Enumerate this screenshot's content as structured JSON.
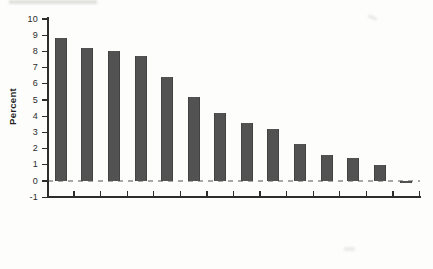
{
  "chart_data": {
    "type": "bar",
    "title": "",
    "xlabel": "",
    "ylabel": "Percent",
    "categories": [
      "Lebanon",
      "Djibouti",
      "Bahrain",
      "Jordan",
      "Egypt, Arab Rep.",
      "Saudi Arabia",
      "Yemen, Rep.",
      "Iraq",
      "Oman",
      "Algeria",
      "Qatar",
      "Tunisia",
      "Morocco",
      "West Bank"
    ],
    "values": [
      8.8,
      8.2,
      8.0,
      7.7,
      6.4,
      5.2,
      4.2,
      3.6,
      3.2,
      2.3,
      1.6,
      1.4,
      1.0,
      -0.15
    ],
    "ylim": [
      -1,
      10
    ],
    "yticks": [
      -1,
      0,
      1,
      2,
      3,
      4,
      5,
      6,
      7,
      8,
      9,
      10
    ],
    "grid": false,
    "legend_position": "none",
    "zero_line_style": "dashed",
    "colors": {
      "bar": "#525252",
      "axis": "#2d2d2d",
      "zero_dash": "#a8a8a6",
      "text": "#2b2b2b"
    }
  }
}
